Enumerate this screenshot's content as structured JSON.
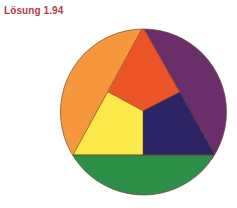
{
  "title": "Lösung 1.94",
  "colors": {
    "title": "#b23a4a",
    "orange": "#f7973d",
    "red_orange": "#eb5428",
    "purple": "#6a2e6b",
    "yellow": "#fbe94a",
    "dark_blue": "#2d2466",
    "green": "#2e8f48",
    "outline": "#6b4a2a"
  },
  "diagram": {
    "type": "color-wheel",
    "segments": [
      "orange",
      "red-orange",
      "purple",
      "yellow",
      "dark-blue",
      "green"
    ]
  }
}
